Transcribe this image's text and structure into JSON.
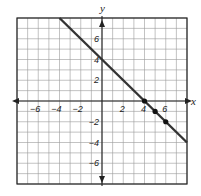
{
  "chart_data": {
    "type": "line",
    "title": "",
    "xlabel": "x",
    "ylabel": "y",
    "xlim": [
      -8,
      8
    ],
    "ylim": [
      -8,
      8
    ],
    "grid": true,
    "x_ticks": [
      -6,
      -4,
      -2,
      2,
      4,
      6
    ],
    "y_ticks": [
      6,
      4,
      2,
      -2,
      -4,
      -6
    ],
    "x_tick_labels": [
      "−6",
      "−4",
      "−2",
      "2",
      "4",
      "6"
    ],
    "y_tick_labels": [
      "6",
      "4",
      "2",
      "−2",
      "−4",
      "−6"
    ],
    "series": [
      {
        "name": "y = -x + 4",
        "x": [
          -4,
          8
        ],
        "y": [
          8,
          -4
        ],
        "color": "#333333"
      }
    ],
    "points": [
      {
        "x": 4,
        "y": 0
      },
      {
        "x": 5,
        "y": -1
      },
      {
        "x": 6,
        "y": -2
      }
    ]
  }
}
